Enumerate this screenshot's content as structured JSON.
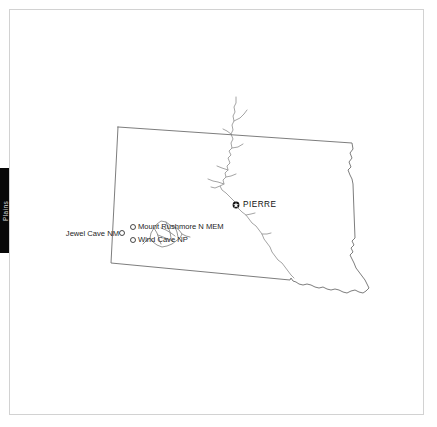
{
  "page": {
    "background_color": "#ffffff",
    "frame_color": "#d2d2d2"
  },
  "edge_tab": {
    "label": "Plains",
    "background_color": "#080808",
    "text_color": "#d8d8d8"
  },
  "map": {
    "title": "South Dakota",
    "state_border_color": "#6e6e6e",
    "river_color": "#9a9a9a",
    "hills_color": "#8a8a8a",
    "capital": {
      "name": "PIERRE",
      "marker": "capital-star-circle",
      "marker_color": "#111111",
      "x": 236,
      "y": 205
    },
    "parks": [
      {
        "name": "Jewel Cave NM",
        "marker": "open-circle",
        "label_side": "left",
        "x": 122,
        "y": 233
      },
      {
        "name": "Mount Rushmore N MEM",
        "marker": "open-circle",
        "label_side": "right",
        "x": 133,
        "y": 227
      },
      {
        "name": "Wind Cave NP",
        "marker": "open-circle",
        "label_side": "right",
        "x": 133,
        "y": 240
      }
    ]
  }
}
